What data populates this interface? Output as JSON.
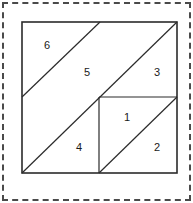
{
  "figure": {
    "canvas": {
      "width": 193,
      "height": 203,
      "background": "#ffffff"
    },
    "selection_border": {
      "style": "dashed",
      "color": "#4a4a4a",
      "width": 2
    },
    "outer_square": {
      "name": "outer-square",
      "x": 22,
      "y": 22,
      "width": 155,
      "height": 151,
      "stroke": "#2b2b2b"
    },
    "inner_square": {
      "name": "inner-square",
      "x": 99,
      "y": 97,
      "width": 78,
      "height": 76,
      "stroke": "#2b2b2b"
    },
    "cut_lines": [
      {
        "name": "upper-left-diagonal",
        "x1": 22,
        "y1": 97,
        "x2": 100,
        "y2": 22
      },
      {
        "name": "main-diagonal",
        "x1": 22,
        "y1": 173,
        "x2": 177,
        "y2": 22
      },
      {
        "name": "inner-square-top-edge",
        "x1": 99,
        "y1": 97,
        "x2": 177,
        "y2": 97
      },
      {
        "name": "inner-square-left-edge",
        "x1": 99,
        "y1": 97,
        "x2": 99,
        "y2": 173
      },
      {
        "name": "inner-square-diagonal",
        "x1": 99,
        "y1": 173,
        "x2": 177,
        "y2": 97
      }
    ],
    "regions": [
      {
        "id": "region-1",
        "label": "1",
        "x": 127,
        "y": 118
      },
      {
        "id": "region-2",
        "label": "2",
        "x": 157,
        "y": 148
      },
      {
        "id": "region-3",
        "label": "3",
        "x": 157,
        "y": 73
      },
      {
        "id": "region-4",
        "label": "4",
        "x": 79,
        "y": 148
      },
      {
        "id": "region-5",
        "label": "5",
        "x": 87,
        "y": 73
      },
      {
        "id": "region-6",
        "label": "6",
        "x": 47,
        "y": 46
      }
    ]
  }
}
